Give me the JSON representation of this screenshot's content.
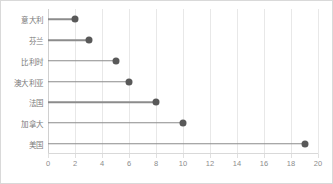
{
  "chart_data": {
    "type": "bar",
    "subtype": "lollipop-dot-plot",
    "orientation": "horizontal",
    "title": "",
    "subtitle": "",
    "xlabel": "",
    "ylabel": "",
    "categories": [
      "意大利",
      "芬兰",
      "比利时",
      "澳大利亚",
      "法国",
      "加拿大",
      "美国"
    ],
    "values": [
      2,
      3,
      5,
      6,
      8,
      10,
      19
    ],
    "xlim": [
      0,
      20
    ],
    "xticks": [
      0,
      2,
      4,
      6,
      8,
      10,
      12,
      14,
      16,
      18,
      20
    ],
    "xtick_labels": [
      "0",
      "2",
      "4",
      "6",
      "8",
      "10",
      "12",
      "14",
      "16",
      "18",
      "20"
    ],
    "grid": "vertical",
    "legend": "none",
    "colors": {
      "dot": "#595959",
      "stem": "#8c8c8c",
      "gridline": "#e8e8e8",
      "axis": "#d9d9d9",
      "label_text": "#7a7a7a",
      "tick_text": "#8c8c8c",
      "background": "#ffffff",
      "border": "#d9d9d9"
    }
  }
}
